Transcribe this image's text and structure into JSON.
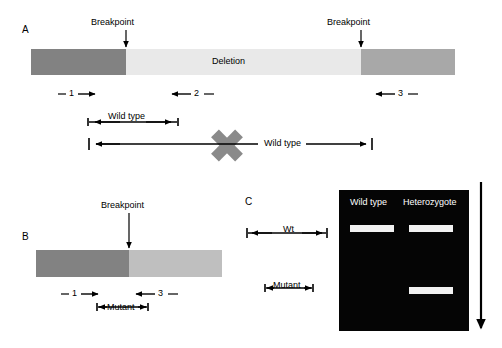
{
  "figure": {
    "panels": {
      "a": {
        "letter": "A",
        "breakpoint_left_label": "Breakpoint",
        "breakpoint_right_label": "Breakpoint",
        "deletion_label": "Deletion",
        "primers": [
          {
            "name": "primer-1",
            "label": "1",
            "direction": "right"
          },
          {
            "name": "primer-2",
            "label": "2",
            "direction": "left"
          },
          {
            "name": "primer-3",
            "label": "3",
            "direction": "left"
          }
        ],
        "product_short_label": "Wild type",
        "product_long_label": "Wild type",
        "segments": [
          {
            "name": "left-flank",
            "color": "#828282"
          },
          {
            "name": "deleted-region",
            "color": "#e9e9e9"
          },
          {
            "name": "right-flank",
            "color": "#a8a8a8"
          }
        ]
      },
      "b": {
        "letter": "B",
        "breakpoint_label": "Breakpoint",
        "primers": [
          {
            "name": "primer-1",
            "label": "1",
            "direction": "right"
          },
          {
            "name": "primer-3",
            "label": "3",
            "direction": "left"
          }
        ],
        "product_label": "Mutant",
        "segments": [
          {
            "name": "left-flank",
            "color": "#828282"
          },
          {
            "name": "right-flank",
            "color": "#bfbfbf"
          }
        ]
      },
      "c": {
        "letter": "C",
        "marker_wt_label": "Wt",
        "marker_mutant_label": "Mutant",
        "gel": {
          "background_color": "#050505",
          "band_color": "#f2f2f2",
          "lanes": [
            {
              "name": "lane-wild-type",
              "label": "Wild type",
              "bands": [
                {
                  "name": "band-wt",
                  "size_class": "wt"
                }
              ]
            },
            {
              "name": "lane-heterozygote",
              "label": "Heterozygote",
              "bands": [
                {
                  "name": "band-wt",
                  "size_class": "wt"
                },
                {
                  "name": "band-mutant",
                  "size_class": "mutant"
                }
              ]
            }
          ]
        },
        "migration_arrow": {
          "name": "migration-direction-arrow",
          "direction": "down"
        }
      }
    },
    "cross_marker": {
      "name": "no-product-cross",
      "color": "#8a8a8a"
    }
  }
}
